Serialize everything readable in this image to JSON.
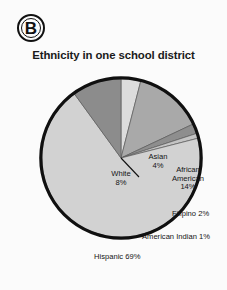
{
  "panel": {
    "letter": "B"
  },
  "chart_data": {
    "type": "pie",
    "title": "Ethnicity in one school district",
    "xlabel": "",
    "ylabel": "",
    "legend_position": "none",
    "grid": false,
    "labels_inline": true,
    "categories": [
      "Asian",
      "African American",
      "Filipino",
      "American Indian",
      "Hispanic",
      "White"
    ],
    "values": [
      4,
      14,
      2,
      1,
      69,
      8
    ],
    "units": "percent",
    "slices": [
      {
        "name": "Asian",
        "label_text": "Asian\n4%",
        "value": 4,
        "value_text": "4%",
        "color": "#dcdcdc",
        "start_angle": 0,
        "end_angle": 14.4
      },
      {
        "name": "African American",
        "label_text": "African\nAmerican\n14%",
        "value": 14,
        "value_text": "14%",
        "color": "#a9a9a9",
        "start_angle": 14.4,
        "end_angle": 64.8
      },
      {
        "name": "Filipino",
        "label_text": "Filipino 2%",
        "value": 2,
        "value_text": "2%",
        "color": "#8e8e8e",
        "start_angle": 64.8,
        "end_angle": 72.0
      },
      {
        "name": "American Indian",
        "label_text": "American Indian 1%",
        "value": 1,
        "value_text": "1%",
        "color": "#c4c4c4",
        "start_angle": 72.0,
        "end_angle": 75.6
      },
      {
        "name": "Hispanic",
        "label_text": "Hispanic 69%",
        "value": 69,
        "value_text": "69%",
        "color": "#d2d2d2",
        "start_angle": 75.6,
        "end_angle": 324.0
      },
      {
        "name": "White",
        "label_text": "White\n8%",
        "value": 8,
        "value_text": "8%",
        "color": "#8c8c8c",
        "start_angle": 324.0,
        "end_angle": 360.0
      }
    ],
    "outline_color": "#101010",
    "background_color": "#fbfbfb"
  }
}
